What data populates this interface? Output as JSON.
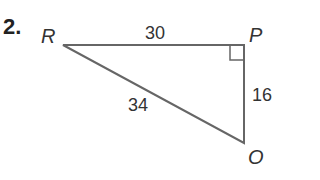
{
  "problem": {
    "number": "2."
  },
  "triangle": {
    "vertices": {
      "R": "R",
      "P": "P",
      "O": "O"
    },
    "sides": {
      "RP": "30",
      "RO": "34",
      "PO": "16"
    },
    "right_angle_at": "P",
    "line_color": "#666666"
  }
}
